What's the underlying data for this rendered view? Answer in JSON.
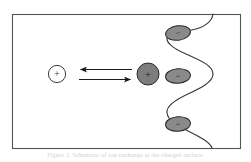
{
  "figure": {
    "type": "schematic-diagram",
    "frame": {
      "x": 12,
      "y": 14,
      "width": 228,
      "height": 134,
      "stroke_color": "#555555",
      "fill_color": "#ffffff",
      "stroke_width": 1.1
    },
    "caption": {
      "text": "Figure 1.  Schematic of ion exchange at the charged surface.",
      "visible": "faint-cropped"
    },
    "colors": {
      "outline": "#2b2b2b",
      "frame_stroke": "#555555",
      "ellipse_fill": "#8a8a8a",
      "circle_fill": "#7d7d7d",
      "open_circle_fill": "#ffffff",
      "wave_stroke": "#3a3a3a",
      "arrow_stroke": "#1a1a1a",
      "background": "#ffffff"
    },
    "elements": {
      "free_cation": {
        "label": "+",
        "name": "free cation",
        "cx": 57,
        "cy": 74,
        "r": 8.6,
        "filled": false
      },
      "bound_cation": {
        "label": "+",
        "name": "adsorbed cation",
        "cx": 148,
        "cy": 74,
        "r": 11.0,
        "filled": true
      },
      "arrows": [
        {
          "name": "reverse-arrow",
          "direction": "left",
          "x1": 132,
          "x2": 79,
          "y": 69.5,
          "label": ""
        },
        {
          "name": "forward-arrow",
          "direction": "right",
          "x1": 79,
          "x2": 132,
          "y": 79.5,
          "label": ""
        }
      ],
      "surface_anions": [
        {
          "label": "−",
          "name": "surface anion 1",
          "cx": 178,
          "cy": 33,
          "rx": 12.5,
          "ry": 7.2,
          "rotate": -8
        },
        {
          "label": "−",
          "name": "surface anion 2",
          "cx": 178,
          "cy": 76,
          "rx": 12.5,
          "ry": 7.2,
          "rotate": -4
        },
        {
          "label": "−",
          "name": "surface anion 3",
          "cx": 178,
          "cy": 124,
          "rx": 12.5,
          "ry": 7.2,
          "rotate": -4
        }
      ],
      "interface_curve": {
        "name": "charged surface boundary",
        "path": "M 213 14 C 212 22 206 26 196 29 C 186 32 172 32 168 36 C 164 41 172 48 186 54 C 202 61 213 66 213 74 C 213 82 201 88 188 94 C 175 100 166 107 167 113 C 168 120 176 125 188 131 C 200 137 210 142 212 148",
        "stroke_width": 1.15
      }
    }
  }
}
